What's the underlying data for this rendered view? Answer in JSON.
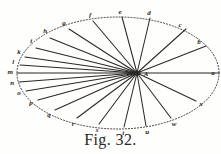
{
  "figure": {
    "caption": "Fig. 32.",
    "center_label": "A",
    "ink_color": "#2b2724",
    "paper_color": "#fefefd",
    "ellipse": {
      "cx": 118,
      "cy": 73,
      "rx": 101,
      "ry": 56,
      "stroke_style": "dotted"
    },
    "center_point": {
      "x": 137,
      "y": 73,
      "description": "focus-convergence-point"
    },
    "perimeter_points": [
      {
        "label": "a",
        "x": 219,
        "y": 73,
        "lx": 213,
        "ly": 73,
        "spoke": true
      },
      {
        "label": "b",
        "x": 206,
        "y": 46,
        "lx": 199,
        "ly": 42,
        "spoke": true
      },
      {
        "label": "c",
        "x": 186,
        "y": 29,
        "lx": 180,
        "ly": 25,
        "spoke": true
      },
      {
        "label": "d",
        "x": 150,
        "y": 18,
        "lx": 149,
        "ly": 13,
        "spoke": true
      },
      {
        "label": "e",
        "x": 122,
        "y": 17,
        "lx": 120,
        "ly": 12,
        "spoke": true
      },
      {
        "label": "f",
        "x": 93,
        "y": 21,
        "lx": 90,
        "ly": 15,
        "spoke": true
      },
      {
        "label": "g",
        "x": 69,
        "y": 29,
        "lx": 64,
        "ly": 23,
        "spoke": true
      },
      {
        "label": "h",
        "x": 50,
        "y": 38,
        "lx": 45,
        "ly": 31,
        "spoke": true
      },
      {
        "label": "i",
        "x": 36,
        "y": 48,
        "lx": 31,
        "ly": 41,
        "spoke": true
      },
      {
        "label": "k",
        "x": 25,
        "y": 57,
        "lx": 19,
        "ly": 52,
        "spoke": true
      },
      {
        "label": "l",
        "x": 20,
        "y": 65,
        "lx": 13,
        "ly": 62,
        "spoke": true
      },
      {
        "label": "m",
        "x": 17,
        "y": 73,
        "lx": 10,
        "ly": 72,
        "spoke": true
      },
      {
        "label": "n",
        "x": 19,
        "y": 82,
        "lx": 12,
        "ly": 83,
        "spoke": true
      },
      {
        "label": "o",
        "x": 26,
        "y": 91,
        "lx": 19,
        "ly": 93,
        "spoke": true
      },
      {
        "label": "p",
        "x": 38,
        "y": 100,
        "lx": 31,
        "ly": 103,
        "spoke": true
      },
      {
        "label": "q",
        "x": 55,
        "y": 110,
        "lx": 49,
        "ly": 115,
        "spoke": true
      },
      {
        "label": "r",
        "x": 77,
        "y": 118,
        "lx": 73,
        "ly": 124,
        "spoke": true
      },
      {
        "label": "s",
        "x": 99,
        "y": 124,
        "lx": 97,
        "ly": 130,
        "spoke": true
      },
      {
        "label": "t",
        "x": 124,
        "y": 127,
        "lx": 123,
        "ly": 133,
        "spoke": true
      },
      {
        "label": "u",
        "x": 146,
        "y": 126,
        "lx": 147,
        "ly": 132,
        "spoke": true
      },
      {
        "label": "w",
        "x": 171,
        "y": 118,
        "lx": 174,
        "ly": 124,
        "spoke": true
      },
      {
        "label": "x",
        "x": 196,
        "y": 101,
        "lx": 201,
        "ly": 104,
        "spoke": true
      }
    ]
  }
}
